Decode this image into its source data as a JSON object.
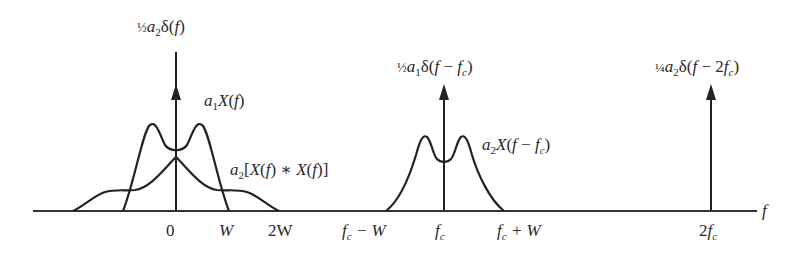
{
  "diagram": {
    "title": "",
    "axis": {
      "variable": "f",
      "ticks": [
        {
          "label": "0",
          "x": 176
        },
        {
          "label": "W",
          "x": 228
        },
        {
          "label": "2W",
          "x": 278
        },
        {
          "label": "f_c − W",
          "x": 386
        },
        {
          "label": "f_c",
          "x": 444
        },
        {
          "label": "f_c + W",
          "x": 503
        },
        {
          "label": "2f_c",
          "x": 711
        }
      ]
    },
    "impulses": [
      {
        "label": "½ a₂δ(f)",
        "position": "0"
      },
      {
        "label": "½ a₁δ(f − f_c)",
        "position": "f_c"
      },
      {
        "label": "¼ a₂δ(f − 2f_c)",
        "position": "2f_c"
      }
    ],
    "spectra": [
      {
        "label": "a₁X(f)",
        "shape": "bimodal",
        "span": "−W to W"
      },
      {
        "label": "a₂[X(f) ∗ X(f)]",
        "shape": "triangular-with-shoulders",
        "span": "−2W to 2W"
      },
      {
        "label": "a₂X(f − f_c)",
        "shape": "bimodal",
        "span": "f_c − W to f_c + W"
      }
    ],
    "colors": {
      "line": "#222222",
      "background": "#ffffff"
    }
  },
  "labels": {
    "delta0": {
      "frac": "½",
      "a": "a",
      "asub": "2",
      "rest": "δ(",
      "f": "f",
      "close": ")"
    },
    "deltafc": {
      "frac": "½",
      "a": "a",
      "asub": "1",
      "rest": "δ(",
      "f": "f",
      "mid": " − ",
      "fc": "f",
      "fcsub": "c",
      "close": ")"
    },
    "delta2fc": {
      "frac": "¼",
      "a": "a",
      "asub": "2",
      "rest": "δ(",
      "f": "f",
      "mid": " − 2",
      "fc": "f",
      "fcsub": "c",
      "close": ")"
    },
    "a1X": {
      "a": "a",
      "asub": "1",
      "X": "X",
      "open": "(",
      "f": "f",
      "close": ")"
    },
    "a2conv": {
      "a": "a",
      "asub": "2",
      "text1": "[",
      "X": "X",
      "open": "(",
      "f": "f",
      "mid": ") ∗ ",
      "X2": "X",
      "open2": "(",
      "f2": "f",
      "close": ")]"
    },
    "a2Xfc": {
      "a": "a",
      "asub": "2",
      "X": "X",
      "open": "(",
      "f": "f",
      "mid": " − ",
      "fc": "f",
      "fcsub": "c",
      "close": ")"
    },
    "tick0": "0",
    "tickW": "W",
    "tick2W": "2W",
    "tickfcW_f": "f",
    "tickfcW_sub": "c",
    "tickfcW_rest": " − W",
    "tickfc_f": "f",
    "tickfc_sub": "c",
    "tickfcpW_f": "f",
    "tickfcpW_sub": "c",
    "tickfcpW_rest": " + W",
    "tick2fc_2": "2",
    "tick2fc_f": "f",
    "tick2fc_sub": "c",
    "axis_var": "f"
  }
}
